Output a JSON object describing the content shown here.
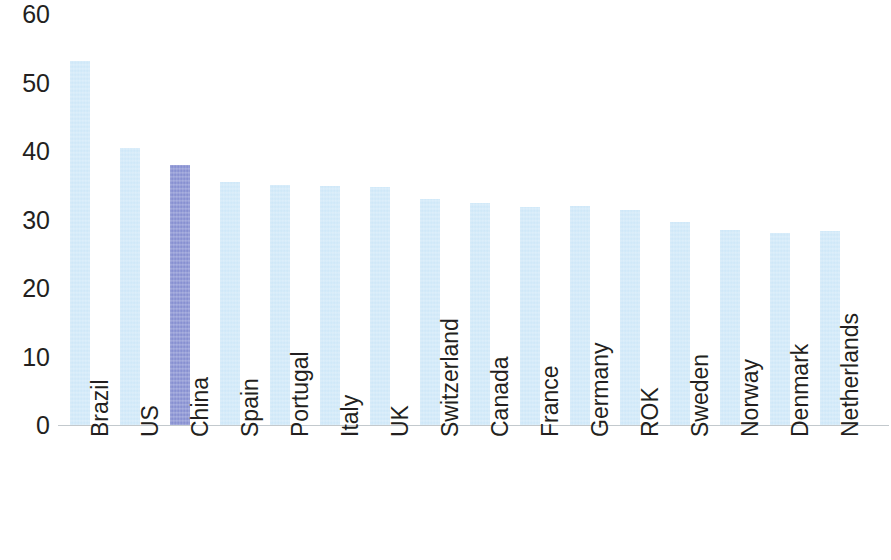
{
  "chart_data": {
    "type": "bar",
    "title": "",
    "subtitle": "",
    "xlabel": "",
    "ylabel": "",
    "ylim": [
      0,
      60
    ],
    "yticks": [
      0,
      10,
      20,
      30,
      40,
      50,
      60
    ],
    "ytick_labels": [
      "0",
      "10",
      "20",
      "30",
      "40",
      "50",
      "60"
    ],
    "grid": false,
    "legend": false,
    "legend_position": "none",
    "categories": [
      "Brazil",
      "US",
      "China",
      "Spain",
      "Portugal",
      "Italy",
      "UK",
      "Switzerland",
      "Canada",
      "France",
      "Germany",
      "ROK",
      "Sweden",
      "Norway",
      "Denmark",
      "Netherlands"
    ],
    "values": [
      53.2,
      40.5,
      38.0,
      35.5,
      35.0,
      34.9,
      34.8,
      33.0,
      32.4,
      31.9,
      32.0,
      31.4,
      29.7,
      28.5,
      28.1,
      28.3
    ],
    "highlight_index": 2,
    "colors": {
      "bar": "#cbe6f8",
      "bar_highlight": "#7c86cd",
      "axis": "#b9bfc4",
      "text": "#231f20",
      "background": "#ffffff"
    }
  },
  "layout": {
    "baseline_y": 425,
    "pixels_per_unit": 6.85,
    "bar_width": 20,
    "bar_step": 50,
    "first_bar_left": 14,
    "label_top": 437
  }
}
